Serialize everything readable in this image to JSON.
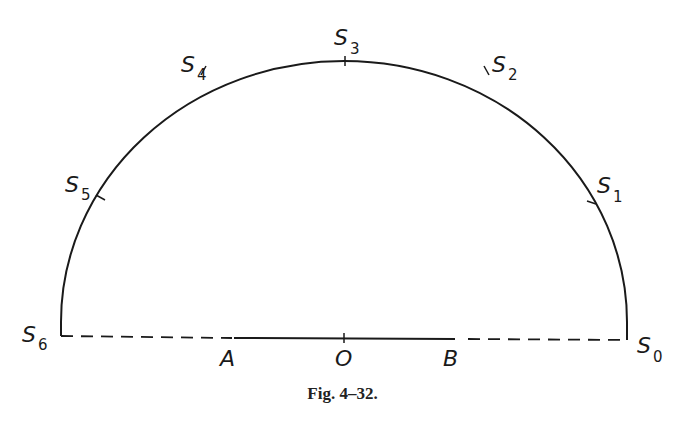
{
  "figure": {
    "caption": "Fig. 4–32.",
    "colors": {
      "stroke": "#1a1a1a",
      "background": "#ffffff"
    },
    "arc_points": [
      {
        "name": "S",
        "sub": "0"
      },
      {
        "name": "S",
        "sub": "1"
      },
      {
        "name": "S",
        "sub": "2"
      },
      {
        "name": "S",
        "sub": "3"
      },
      {
        "name": "S",
        "sub": "4"
      },
      {
        "name": "S",
        "sub": "5"
      },
      {
        "name": "S",
        "sub": "6"
      }
    ],
    "segment_points": {
      "A": "A",
      "O": "O",
      "B": "B"
    }
  }
}
